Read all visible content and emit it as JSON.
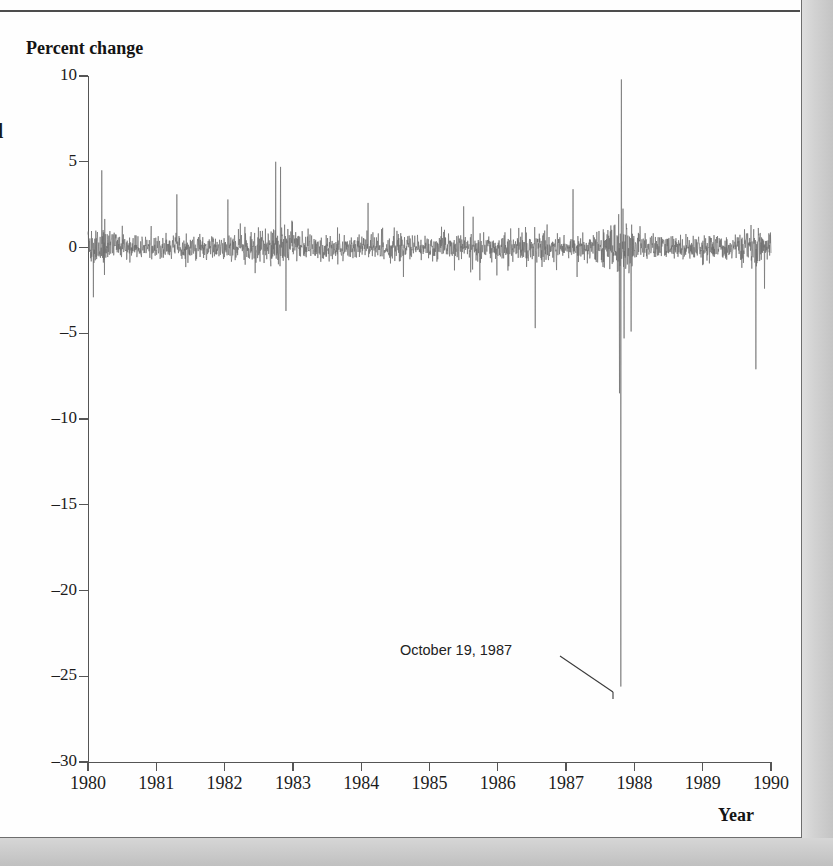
{
  "figure": {
    "caption_fragment": "d",
    "y_axis_title": "Percent change",
    "x_axis_title": "Year"
  },
  "annotation": {
    "label": "October 19, 1987",
    "target_value": -25.6,
    "target_date": 1987.8
  },
  "colors": {
    "series": "#6b6b6b",
    "axis": "#555555",
    "text": "#1c1c1c",
    "page": "#fefefe",
    "margin": "#c9c9c9"
  },
  "chart_data": {
    "type": "line",
    "title": "",
    "subtitle": "",
    "xlabel": "Year",
    "ylabel": "Percent change",
    "grid": false,
    "legend": "none",
    "xlim": [
      1980,
      1990
    ],
    "ylim": [
      -30,
      10
    ],
    "xticks": [
      1980,
      1981,
      1982,
      1983,
      1984,
      1985,
      1986,
      1987,
      1988,
      1989,
      1990
    ],
    "xtick_labels": [
      "1980",
      "1981",
      "1982",
      "1983",
      "1984",
      "1985",
      "1986",
      "1987",
      "1988",
      "1989",
      "1990"
    ],
    "yticks": [
      10,
      5,
      0,
      -5,
      -10,
      -15,
      -20,
      -25,
      -30
    ],
    "ytick_labels": [
      "10",
      "5",
      "0",
      "-5",
      "-10",
      "-15",
      "-20",
      "-25",
      "-30"
    ],
    "series_name": "Daily percent change in stock price index",
    "noise_band": [
      -2.0,
      2.0
    ],
    "annotations": [
      {
        "label": "October 19, 1987",
        "x": 1987.8,
        "y": -25.6
      }
    ],
    "notable_points": [
      {
        "date": 1980.08,
        "value": -2.9,
        "note": "early 1980 drop"
      },
      {
        "date": 1980.2,
        "value": 4.5,
        "note": "1980 rebound spike"
      },
      {
        "date": 1981.3,
        "value": 3.1
      },
      {
        "date": 1982.05,
        "value": 2.8
      },
      {
        "date": 1982.75,
        "value": 5.0,
        "note": "August 1982 rally"
      },
      {
        "date": 1982.82,
        "value": 4.7
      },
      {
        "date": 1982.9,
        "value": -3.7,
        "note": "late 1982 dip"
      },
      {
        "date": 1984.1,
        "value": 2.6
      },
      {
        "date": 1985.5,
        "value": 2.4
      },
      {
        "date": 1986.55,
        "value": -4.7,
        "note": "mid 1986 dip"
      },
      {
        "date": 1987.1,
        "value": 3.4
      },
      {
        "date": 1987.78,
        "value": -8.5,
        "note": "pre-crash slide"
      },
      {
        "date": 1987.8,
        "value": -25.6,
        "note": "Black Monday, October 19, 1987"
      },
      {
        "date": 1987.81,
        "value": 9.8,
        "note": "October 20, 1987 rebound"
      },
      {
        "date": 1987.85,
        "value": -5.3
      },
      {
        "date": 1987.95,
        "value": -4.9
      },
      {
        "date": 1989.78,
        "value": -7.1,
        "note": "October 13, 1989 mini-crash"
      }
    ],
    "series_stats": {
      "min": -25.6,
      "max": 9.8,
      "mean": 0.05,
      "n_points": 2530,
      "frequency": "daily"
    }
  }
}
